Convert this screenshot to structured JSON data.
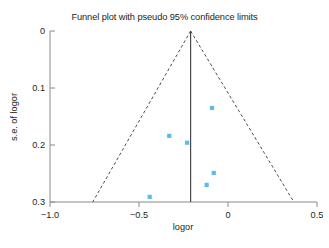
{
  "figure": {
    "title": "Funnel plot with pseudo 95% confidence limits",
    "caption": ""
  },
  "chart_data": {
    "type": "scatter",
    "title": "Funnel plot with pseudo 95% confidence limits",
    "xlabel": "logor",
    "ylabel": "s.e. of logor",
    "xlim": [
      -1.0,
      0.5
    ],
    "ylim": [
      0.3,
      0
    ],
    "y_axis_inverted": true,
    "grid": false,
    "legend": null,
    "xticks": [
      -1.0,
      -0.5,
      0,
      0.5
    ],
    "xticklabels": [
      "−1.0",
      "−0.5",
      "0",
      "0.5"
    ],
    "yticks": [
      0,
      0.1,
      0.2,
      0.3
    ],
    "yticklabels": [
      "0",
      "0.1",
      "0.2",
      "0.3"
    ],
    "points": [
      {
        "x": -0.09,
        "y": 0.135
      },
      {
        "x": -0.33,
        "y": 0.184
      },
      {
        "x": -0.23,
        "y": 0.196
      },
      {
        "x": -0.08,
        "y": 0.249
      },
      {
        "x": -0.12,
        "y": 0.27
      },
      {
        "x": -0.44,
        "y": 0.291
      }
    ],
    "point_color": "#4fb4e8",
    "point_marker": "square",
    "pooled_effect_line": {
      "x": -0.21,
      "style": "solid",
      "color": "#3a3a3a",
      "y_from": 0.0,
      "y_to": 0.3
    },
    "pseudo_95_limits": {
      "style": "dashed",
      "color": "#3a3a3a",
      "apex": {
        "x": -0.21,
        "y": 0.0
      },
      "lower_left": {
        "x": -0.76,
        "y": 0.3
      },
      "lower_right": {
        "x": 0.37,
        "y": 0.3
      }
    }
  }
}
